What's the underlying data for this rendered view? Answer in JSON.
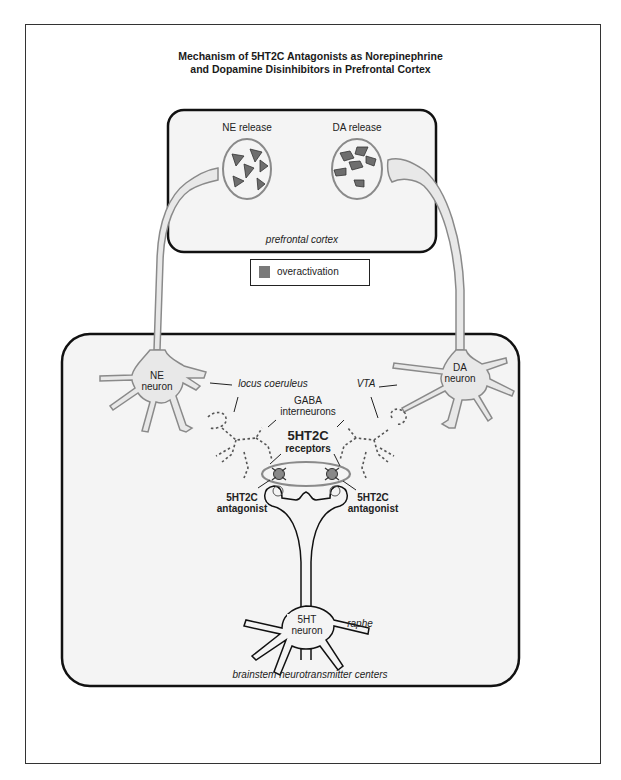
{
  "figure": {
    "title_line1": "Mechanism of 5HT2C Antagonists as Norepinephrine",
    "title_line2": "and Dopamine Disinhibitors in Prefrontal Cortex"
  },
  "prefrontal_box": {
    "ne_release": "NE release",
    "da_release": "DA release",
    "region_label": "prefrontal cortex"
  },
  "legend": {
    "label": "overactivation",
    "swatch_color": "#7a7a7a"
  },
  "brainstem_box": {
    "ne_neuron_line1": "NE",
    "ne_neuron_line2": "neuron",
    "da_neuron_line1": "DA",
    "da_neuron_line2": "neuron",
    "locus_coeruleus": "locus coeruleus",
    "vta": "VTA",
    "gaba_line1": "GABA",
    "gaba_line2": "interneurons",
    "receptors_line1": "5HT2C",
    "receptors_line2": "receptors",
    "antagonist_left_line1": "5HT2C",
    "antagonist_left_line2": "antagonist",
    "antagonist_right_line1": "5HT2C",
    "antagonist_right_line2": "antagonist",
    "sht_neuron_line1": "5HT",
    "sht_neuron_line2": "neuron",
    "raphe": "raphe",
    "region_label": "brainstem neurotransmitter centers"
  },
  "colors": {
    "neuron_fill": "#e8e8e8",
    "neuron_stroke": "#8a8a8a",
    "vesicle_stroke": "#8a8a8a",
    "transmitter_fill": "#6e6e6e",
    "box_stroke": "#111111",
    "box_fill": "#f4f4f4"
  }
}
